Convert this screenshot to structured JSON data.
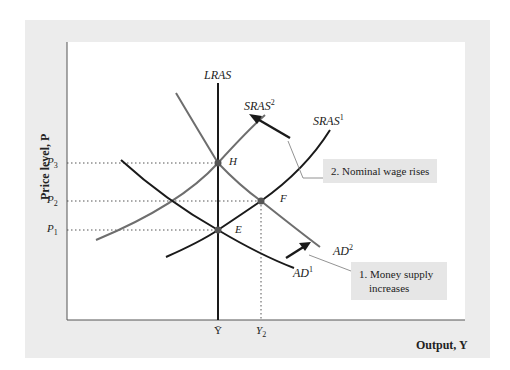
{
  "axes": {
    "y_label": "Price level, P",
    "x_label": "Output, Y",
    "y_ticks": [
      {
        "label": "P3",
        "sub": "3",
        "y": 163
      },
      {
        "label": "P2",
        "sub": "2",
        "y": 201
      },
      {
        "label": "P1",
        "sub": "1",
        "y": 230
      }
    ],
    "x_ticks": [
      {
        "label": "Ȳ",
        "x": 218
      },
      {
        "label": "Y2",
        "x": 261
      }
    ]
  },
  "curves": {
    "lras": "LRAS",
    "sras1": {
      "name": "SRAS",
      "sup": "1"
    },
    "sras2": {
      "name": "SRAS",
      "sup": "2"
    },
    "ad1": {
      "name": "AD",
      "sup": "1"
    },
    "ad2": {
      "name": "AD",
      "sup": "2"
    }
  },
  "points": {
    "E": "E",
    "F": "F",
    "H": "H"
  },
  "callouts": {
    "step1_line1": "1. Money supply",
    "step1_line2": "increases",
    "step2": "2. Nominal wage rises"
  },
  "ticks_text": {
    "p_base": "P",
    "p3_sub": "3",
    "p2_sub": "2",
    "p1_sub": "1",
    "ybar": "Ȳ",
    "y_base": "Y",
    "y2_sub": "2"
  },
  "colors": {
    "frame_bg": "#ececec",
    "plot_bg": "#ffffff",
    "dark_curve": "#1a1a1a",
    "gray_curve": "#6e6e6e",
    "callout_bg": "#e6e6e6"
  }
}
